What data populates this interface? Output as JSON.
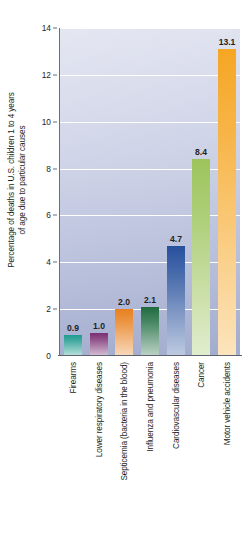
{
  "chart_data": {
    "type": "bar",
    "title": "",
    "xlabel": "",
    "ylabel_line1": "Percentage of deaths in U.S. children 1 to 4 years",
    "ylabel_line2": "of age due to particular causes",
    "ylim": [
      0,
      14
    ],
    "ytick_labels": [
      "14",
      "12",
      "10",
      "8",
      "6",
      "4",
      "2",
      "0"
    ],
    "ytick_values": [
      14,
      12,
      10,
      8,
      6,
      4,
      2,
      0
    ],
    "grid": true,
    "legend": "none",
    "categories": [
      "Firearms",
      "Lower respiratory diseases",
      "Septicemia (bacteria in the blood)",
      "Influenza and pneumonia",
      "Cardiovascular diseases",
      "Cancer",
      "Motor vehicle accidents"
    ],
    "values": [
      0.9,
      1.0,
      2.0,
      2.1,
      4.7,
      8.4,
      13.1
    ],
    "value_labels": [
      "0.9",
      "1.0",
      "2.0",
      "2.1",
      "4.7",
      "8.4",
      "13.1"
    ],
    "bar_colors": [
      "#1f9a8e",
      "#7a2f72",
      "#e8801f",
      "#1f6b40",
      "#27509c",
      "#9cc45c",
      "#f5a623"
    ],
    "plot_background": "#c9cfe4",
    "gridline_color": "#ffffff",
    "axis_color": "#6b6f78",
    "text_color": "#231f20"
  }
}
